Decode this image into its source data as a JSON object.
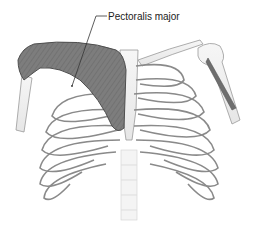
{
  "figure": {
    "labels": [
      {
        "text": "Pectoralis major"
      }
    ]
  },
  "colors": {
    "muscle": "#7a7a7a",
    "muscle_dark": "#555555",
    "bone_fill": "#f2f2f2",
    "bone_stroke": "#8a8a8a",
    "leader_line": "#333333"
  }
}
